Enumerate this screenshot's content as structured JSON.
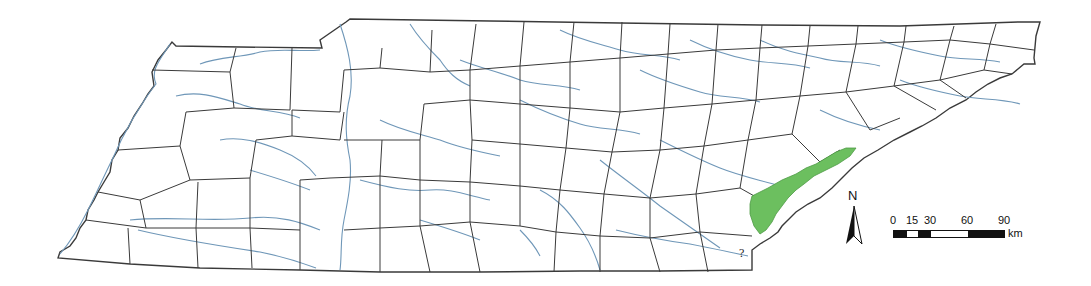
{
  "map": {
    "subject": "Tennessee county map with rivers",
    "colors": {
      "county_border": "#3a3a3a",
      "river": "#6f97b8",
      "highlight_region": "#6cbf5f",
      "background": "#ffffff"
    },
    "highlighted_region_note": "green shaded area along eastern border",
    "unknown_marker": "?"
  },
  "north_arrow": {
    "label": "N"
  },
  "scale_bar": {
    "ticks": [
      "0",
      "15",
      "30",
      "60",
      "90"
    ],
    "unit": "km"
  }
}
